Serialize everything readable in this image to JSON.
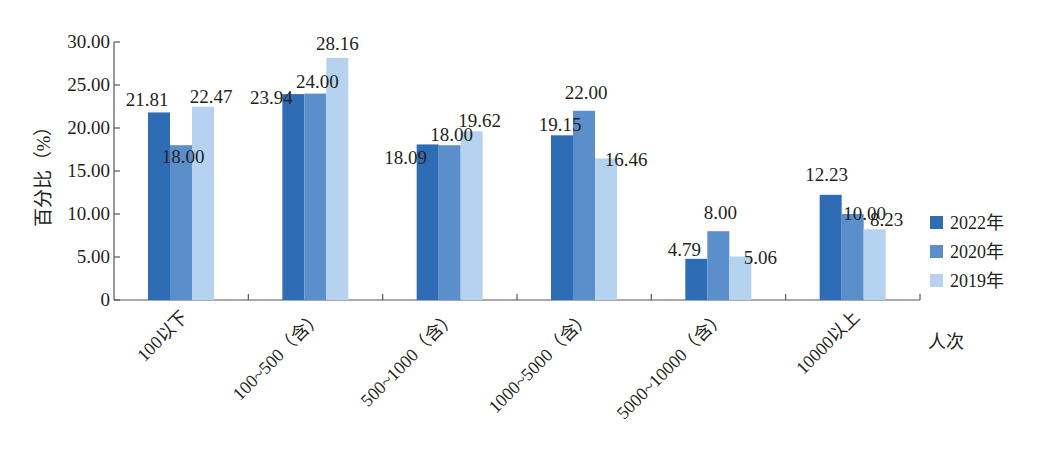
{
  "chart_data": {
    "type": "bar",
    "title": "",
    "xlabel": "人次",
    "ylabel": "百分比（%）",
    "ylim": [
      0,
      30
    ],
    "yticks": [
      "0",
      "5.00",
      "10.00",
      "15.00",
      "20.00",
      "25.00",
      "30.00"
    ],
    "grid": false,
    "legend_position": "right",
    "categories": [
      "100以下",
      "100~500（含）",
      "500~1000（含）",
      "1000~5000（含）",
      "5000~10000（含）",
      "10000以上"
    ],
    "series": [
      {
        "name": "2022年",
        "color": "#2e6db5",
        "values": [
          21.81,
          23.94,
          18.09,
          19.15,
          4.79,
          12.23
        ],
        "labels": [
          "21.81",
          "23.94",
          "18.09",
          "19.15",
          "4.79",
          "12.23"
        ]
      },
      {
        "name": "2020年",
        "color": "#5b8fcc",
        "values": [
          18.0,
          24.0,
          18.0,
          22.0,
          8.0,
          10.0
        ],
        "labels": [
          "18.00",
          "24.00",
          "18.00",
          "22.00",
          "8.00",
          "10.00"
        ]
      },
      {
        "name": "2019年",
        "color": "#b5d2ee",
        "values": [
          22.47,
          28.16,
          19.62,
          16.46,
          5.06,
          8.23
        ],
        "labels": [
          "22.47",
          "28.16",
          "19.62",
          "16.46",
          "5.06",
          "8.23"
        ]
      }
    ]
  }
}
